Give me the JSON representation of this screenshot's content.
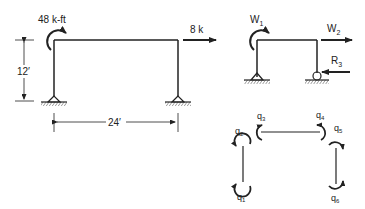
{
  "left_frame": {
    "moment_label": "48 k-ft",
    "load_label": "8 k",
    "height_label": "12′",
    "span_label": "24′",
    "supports": [
      "pin",
      "pin"
    ]
  },
  "right_frame": {
    "moment_label": "W",
    "moment_sub": "1",
    "load_label": "W",
    "load_sub": "2",
    "reaction_label": "R",
    "reaction_sub": "3",
    "supports": [
      "pin",
      "roller"
    ]
  },
  "element_dofs": {
    "labels": [
      {
        "base": "q",
        "sub": "1"
      },
      {
        "base": "q",
        "sub": "2"
      },
      {
        "base": "q",
        "sub": "3"
      },
      {
        "base": "q",
        "sub": "4"
      },
      {
        "base": "q",
        "sub": "5"
      },
      {
        "base": "q",
        "sub": "6"
      }
    ]
  },
  "colors": {
    "line": "#222222",
    "background": "#ffffff"
  }
}
